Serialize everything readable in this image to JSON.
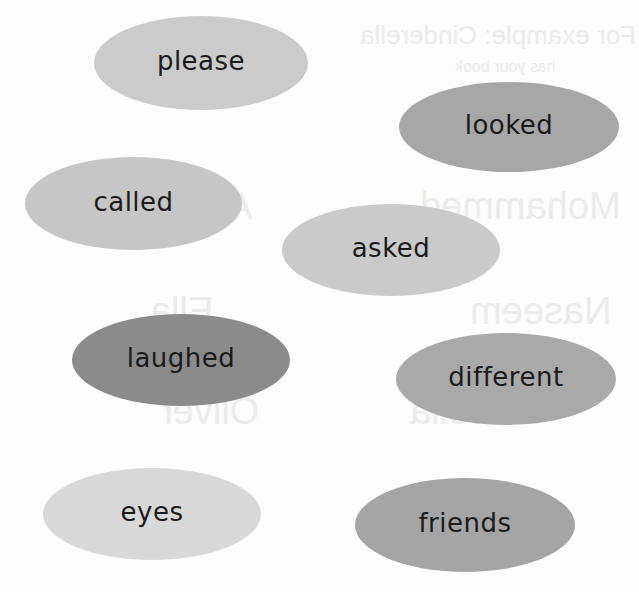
{
  "worksheet": {
    "words": [
      {
        "label": "please",
        "color": "#cbcbcb"
      },
      {
        "label": "looked",
        "color": "#a7a7a7"
      },
      {
        "label": "called",
        "color": "#c6c6c6"
      },
      {
        "label": "asked",
        "color": "#cacaca"
      },
      {
        "label": "laughed",
        "color": "#8b8b8b"
      },
      {
        "label": "different",
        "color": "#a9a9a9"
      },
      {
        "label": "eyes",
        "color": "#d8d8d8"
      },
      {
        "label": "friends",
        "color": "#a5a5a5"
      }
    ],
    "showthrough": {
      "line1": "For example: Cinderella",
      "line2": "has your book",
      "names": [
        "Alice",
        "Mohammed",
        "Ella",
        "Naseem",
        "Isabella",
        "Oliver",
        "Poppy"
      ]
    }
  }
}
